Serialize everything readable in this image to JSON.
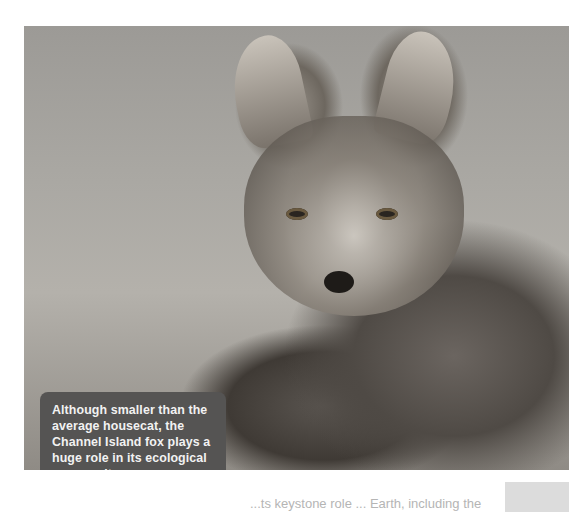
{
  "page": {
    "ghost_heading": "",
    "photo": {
      "subject": "Channel Island fox",
      "alt": "Close-up photo of a Channel Island fox lying on the ground"
    },
    "caption": {
      "text": "Although smaller than the average housecat, the Channel Island fox plays a huge role in its ecological community."
    },
    "body_text_partial": "...ts keystone role ... Earth, including the"
  }
}
